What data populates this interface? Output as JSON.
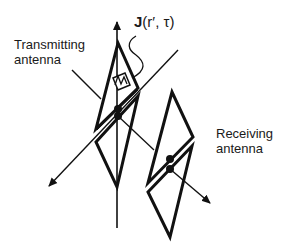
{
  "diagram": {
    "type": "antenna-schematic",
    "labels": {
      "transmitting_line1": "Transmitting",
      "transmitting_line2": "antenna",
      "receiving_line1": "Receiving",
      "receiving_line2": "antenna",
      "current_symbol_bold": "J",
      "current_args": "(r′, τ)"
    },
    "colors": {
      "stroke": "#111111",
      "background": "#ffffff"
    },
    "elements": [
      {
        "id": "transmitting-antenna",
        "shape": "bow-tie dipole (two triangles)"
      },
      {
        "id": "receiving-antenna",
        "shape": "bow-tie dipole (two triangles)"
      },
      {
        "id": "vertical-axis",
        "shape": "arrow pointing up"
      },
      {
        "id": "diagonal-axis",
        "shape": "arrow pointing down-left"
      },
      {
        "id": "propagation-arrow",
        "shape": "arrow pointing down-right"
      },
      {
        "id": "current-source",
        "shape": "boxed zigzag symbol"
      }
    ]
  }
}
